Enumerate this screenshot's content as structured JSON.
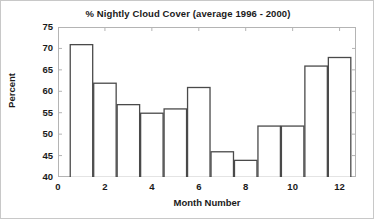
{
  "chart_data": {
    "type": "bar",
    "title": "% Nightly Cloud Cover (average 1996 - 2000)",
    "xlabel": "Month Number",
    "ylabel": "Percent",
    "categories": [
      1,
      2,
      3,
      4,
      5,
      6,
      7,
      8,
      9,
      10,
      11,
      12
    ],
    "values": [
      71,
      62,
      57,
      55,
      56,
      61,
      46,
      44,
      52,
      52,
      66,
      68
    ],
    "xlim": [
      0,
      12.7
    ],
    "ylim": [
      40,
      75
    ],
    "yticks": [
      40,
      45,
      50,
      55,
      60,
      65,
      70,
      75
    ],
    "ytick_labels": [
      "40",
      "45",
      "50",
      "55",
      "60",
      "65",
      "70",
      "75"
    ],
    "xticks": [
      0,
      2,
      4,
      6,
      8,
      10,
      12
    ],
    "xtick_labels": [
      "0",
      "2",
      "4",
      "6",
      "8",
      "10",
      "12"
    ],
    "grid": false,
    "legend": null,
    "bar_width": 1,
    "bar_fill_color": "#ffffff",
    "bar_edge_color": "#4a4a4a",
    "axis_color": "#b4b4b4",
    "text_color": "#1a1a1a",
    "background_color": "#ffffff"
  }
}
